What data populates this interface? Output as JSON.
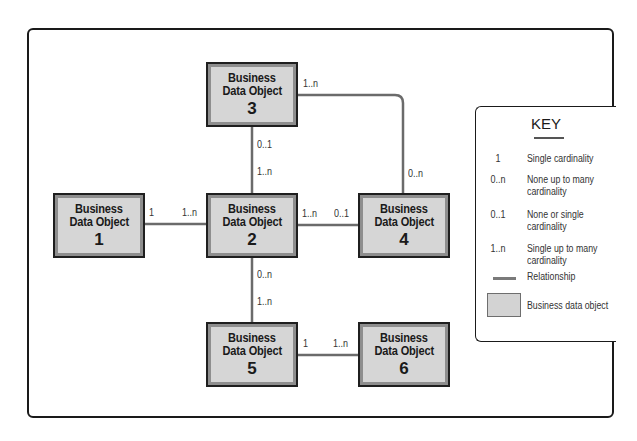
{
  "diagram": {
    "objects": [
      {
        "id": "1",
        "line1": "Business",
        "line2": "Data Object",
        "number": "1"
      },
      {
        "id": "2",
        "line1": "Business",
        "line2": "Data Object",
        "number": "2"
      },
      {
        "id": "3",
        "line1": "Business",
        "line2": "Data Object",
        "number": "3"
      },
      {
        "id": "4",
        "line1": "Business",
        "line2": "Data Object",
        "number": "4"
      },
      {
        "id": "5",
        "line1": "Business",
        "line2": "Data Object",
        "number": "5"
      },
      {
        "id": "6",
        "line1": "Business",
        "line2": "Data Object",
        "number": "6"
      }
    ],
    "relationships": [
      {
        "from": "1",
        "to": "2",
        "from_card": "1",
        "to_card": "1..n"
      },
      {
        "from": "3",
        "to": "2",
        "from_card": "0..1",
        "to_card": "1..n"
      },
      {
        "from": "2",
        "to": "4",
        "from_card": "1..n",
        "to_card": "0..1"
      },
      {
        "from": "3",
        "to": "4",
        "from_card": "1..n",
        "to_card": "0..n"
      },
      {
        "from": "2",
        "to": "5",
        "from_card": "0..n",
        "to_card": "1..n"
      },
      {
        "from": "5",
        "to": "6",
        "from_card": "1",
        "to_card": "1..n"
      }
    ]
  },
  "key": {
    "title": "KEY",
    "items": [
      {
        "symbol": "1",
        "description": "Single cardinality"
      },
      {
        "symbol": "0..n",
        "description": "None up to many cardinality",
        "desc1": "None up to many",
        "desc2": "cardinality"
      },
      {
        "symbol": "0..1",
        "description": "None or single cardinality",
        "desc1": "None or single",
        "desc2": "cardinality"
      },
      {
        "symbol": "1..n",
        "description": "Single up to many cardinality",
        "desc1": "Single up to many",
        "desc2": "cardinality"
      },
      {
        "symbol": "line",
        "description": "Relationship"
      },
      {
        "symbol": "box",
        "description": "Business data object"
      }
    ]
  },
  "colors": {
    "box_fill": "#d6d6d6",
    "box_shadow_border": "#8e8e8e",
    "box_outline": "#1f1f1f",
    "connector": "#6b6b6b",
    "frame": "#1a1a1a"
  }
}
